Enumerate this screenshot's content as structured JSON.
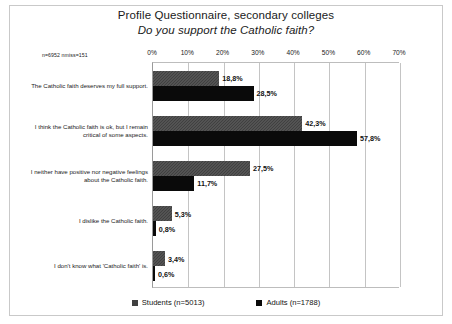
{
  "title": {
    "line1": "Profile Questionnaire, secondary colleges",
    "line2": "Do you support the Catholic faith?"
  },
  "note": "n=6952 nmiss=151",
  "legend": {
    "items": [
      {
        "label": "Students (n=5013)",
        "color": "#404040"
      },
      {
        "label": "Adults (n=1788)",
        "color": "#0a0a0a"
      }
    ]
  },
  "chart_data": {
    "type": "bar",
    "orientation": "horizontal",
    "xlabel": "",
    "ylabel": "",
    "xlim": [
      0,
      70
    ],
    "xticks": [
      "0%",
      "10%",
      "20%",
      "30%",
      "40%",
      "50%",
      "60%",
      "70%"
    ],
    "xtick_values": [
      0,
      10,
      20,
      30,
      40,
      50,
      60,
      70
    ],
    "grid": true,
    "legend_position": "bottom",
    "categories": [
      "The Catholic faith deserves my full support.",
      "I think the Catholic faith is ok, but I remain critical of some aspects.",
      "I neither have positive nor negative feelings about the Catholic faith.",
      "I dislike the Catholic faith.",
      "I don't know what 'Catholic faith' is."
    ],
    "series": [
      {
        "name": "Students (n=5013)",
        "color": "#404040",
        "values": [
          18.8,
          42.3,
          27.5,
          5.3,
          3.4
        ],
        "labels": [
          "18,8%",
          "42,3%",
          "27,5%",
          "5,3%",
          "3,4%"
        ]
      },
      {
        "name": "Adults (n=1788)",
        "color": "#0a0a0a",
        "values": [
          28.5,
          57.8,
          11.7,
          0.8,
          0.6
        ],
        "labels": [
          "28,5%",
          "57,8%",
          "11,7%",
          "0,8%",
          "0,6%"
        ]
      }
    ]
  }
}
